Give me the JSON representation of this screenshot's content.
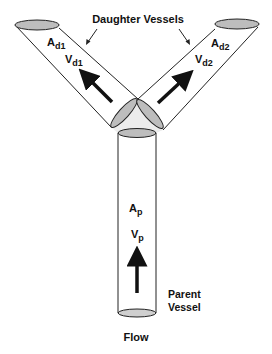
{
  "diagram": {
    "type": "vessel-bifurcation",
    "title_label": "Daughter Vessels",
    "daughter1": {
      "area_main": "A",
      "area_sub": "d1",
      "velocity_main": "V",
      "velocity_sub": "d1"
    },
    "daughter2": {
      "area_main": "A",
      "area_sub": "d2",
      "velocity_main": "V",
      "velocity_sub": "d2"
    },
    "parent": {
      "area_main": "A",
      "area_sub": "p",
      "velocity_main": "V",
      "velocity_sub": "p"
    },
    "parent_label_line1": "Parent",
    "parent_label_line2": "Vessel",
    "flow_label": "Flow",
    "colors": {
      "outline": "#222222",
      "ellipse_fill": "#bdbdbd",
      "junction_fill": "#ececec",
      "arrow": "#111111",
      "background": "#ffffff"
    }
  }
}
